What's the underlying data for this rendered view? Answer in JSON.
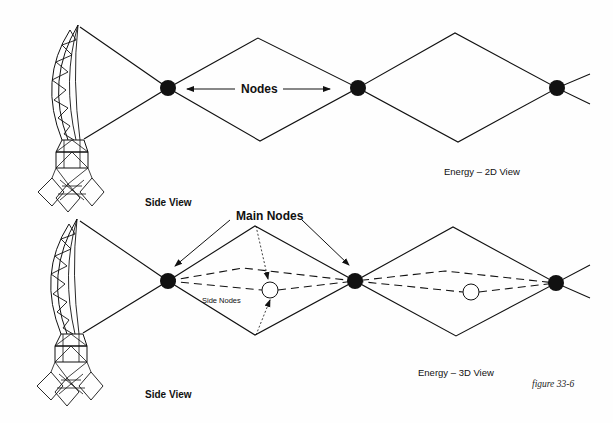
{
  "top_panel": {
    "nodes_label": "Nodes",
    "caption": "Energy – 2D View",
    "side_view_label": "Side View"
  },
  "bottom_panel": {
    "main_nodes_label": "Main Nodes",
    "side_nodes_label": "Side Nodes",
    "caption": "Energy – 3D View",
    "side_view_label": "Side View"
  },
  "figure_label": "figure 33-6",
  "colors": {
    "ink": "#111111",
    "background": "#fefefe"
  }
}
